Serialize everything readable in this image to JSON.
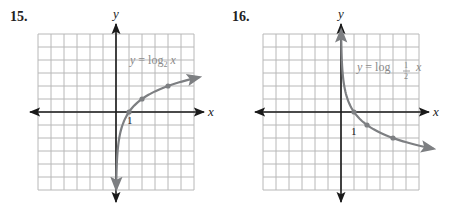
{
  "colors": {
    "grid": "#b8b8b8",
    "axis": "#1a1a1a",
    "curve": "#7d7f82",
    "text": "#222222",
    "equation": "#8a8a8a"
  },
  "chart_data": [
    {
      "type": "line",
      "problem_number": "15.",
      "title": "y = log2 x",
      "equation_label": {
        "prefix": "y = log",
        "base": "2",
        "suffix": "x"
      },
      "xlabel": "x",
      "ylabel": "y",
      "xlim": [
        -6,
        6
      ],
      "ylim": [
        -6,
        6
      ],
      "grid": true,
      "tick_label": "1",
      "marked_points": [
        [
          1,
          0
        ],
        [
          2,
          1
        ],
        [
          4,
          2
        ]
      ],
      "function": "log2(x)",
      "x": [
        0.016,
        0.03,
        0.0625,
        0.125,
        0.25,
        0.5,
        1,
        2,
        4,
        6.5
      ],
      "y": [
        -6,
        -5.06,
        -4,
        -3,
        -2,
        -1,
        0,
        1,
        2,
        2.7
      ]
    },
    {
      "type": "line",
      "problem_number": "16.",
      "title": "y = log1/2 x",
      "equation_label": {
        "prefix": "y = log",
        "base_num": "1",
        "base_den": "2",
        "suffix": "x"
      },
      "xlabel": "x",
      "ylabel": "y",
      "xlim": [
        -6,
        6
      ],
      "ylim": [
        -6,
        6
      ],
      "grid": true,
      "tick_label": "1",
      "marked_points": [
        [
          1,
          0
        ],
        [
          2,
          -1
        ],
        [
          4,
          -2
        ]
      ],
      "function": "log_(1/2)(x)",
      "x": [
        0.0125,
        0.03,
        0.0625,
        0.125,
        0.25,
        0.5,
        1,
        2,
        4,
        7.2
      ],
      "y": [
        6.3,
        5.06,
        4,
        3,
        2,
        1,
        0,
        -1,
        -2,
        -2.85
      ]
    }
  ]
}
